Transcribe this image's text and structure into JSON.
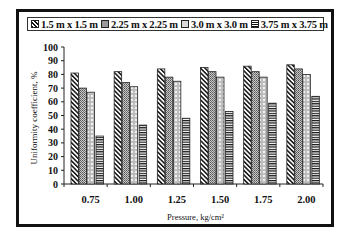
{
  "chart_data": {
    "type": "bar",
    "title": "",
    "xlabel": "Pressure, kg/cm²",
    "ylabel": "Uniformity coefficient, %",
    "ylim": [
      0,
      100
    ],
    "yticks": [
      0,
      10,
      20,
      30,
      40,
      50,
      60,
      70,
      80,
      90,
      100
    ],
    "categories": [
      "0.75",
      "1.00",
      "1.25",
      "1.50",
      "1.75",
      "2.00"
    ],
    "legend_position": "top",
    "grid": false,
    "series": [
      {
        "name": "1.5 m x 1.5 m",
        "pattern": "diagonal-hatch",
        "values": [
          81,
          82,
          84,
          85,
          86,
          87
        ]
      },
      {
        "name": "2.25 m x 2.25 m",
        "pattern": "dense-dots-gray",
        "values": [
          70,
          74,
          78,
          82,
          82,
          84
        ]
      },
      {
        "name": "3.0 m x 3.0 m",
        "pattern": "checker-light",
        "values": [
          67,
          71,
          75,
          78,
          78,
          80
        ]
      },
      {
        "name": "3.75 m x 3.75 m",
        "pattern": "horizontal-lines",
        "values": [
          35,
          43,
          48,
          53,
          59,
          64
        ]
      }
    ]
  },
  "legend": {
    "items": [
      {
        "label": "1.5 m x 1.5 m"
      },
      {
        "label": "2.25 m x 2.25 m"
      },
      {
        "label": "3.0 m x 3.0 m"
      },
      {
        "label": "3.75 m x 3.75 m"
      }
    ]
  },
  "axes": {
    "x_title": "Pressure, kg/cm²",
    "y_title": "Uniformity coefficient, %"
  }
}
